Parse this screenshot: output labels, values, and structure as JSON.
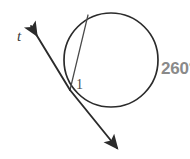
{
  "figure": {
    "type": "circle-tangent-chord-diagram",
    "background_color": "#ffffff",
    "width": 190,
    "height": 159,
    "stroke_color": "#2b2b2b",
    "labels": {
      "tangent_line": "t",
      "angle": "1",
      "arc_measure": "260°"
    },
    "label_colors": {
      "tangent_line": "#3b3b3b",
      "angle": "#4a4a4a",
      "arc_measure": "#8a8a8a"
    },
    "circle": {
      "center_x": 111,
      "center_y": 60,
      "radius": 47
    },
    "tangent_point": {
      "x": 70,
      "y": 90
    },
    "chord_endpoint": {
      "x": 88,
      "y": 15
    },
    "tangent_line_endpoints": {
      "arrow_start_x": 29,
      "arrow_start_y": 24,
      "arrow_end_x": 119,
      "arrow_end_y": 151
    },
    "icons": {
      "arrow_upper": "arrowhead-up-left-icon",
      "arrow_lower": "arrowhead-down-right-icon"
    }
  }
}
